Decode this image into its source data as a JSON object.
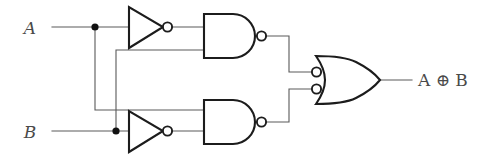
{
  "diagram": {
    "type": "logic-circuit",
    "colors": {
      "gate_stroke": "#1c1c1c",
      "wire_stroke": "#5a5a5a",
      "junction_fill": "#111111",
      "text_fill": "#4a4a4a",
      "background": "#ffffff"
    },
    "inputs": [
      {
        "id": "input-a",
        "label": "A",
        "x": 30,
        "y": 34,
        "wire_y": 27
      },
      {
        "id": "input-b",
        "label": "B",
        "x": 30,
        "y": 138,
        "wire_y": 131
      }
    ],
    "output": {
      "id": "output-xor",
      "label": "A ⊕ B",
      "operand_left": "A",
      "operator": "⊕",
      "operand_right": "B",
      "x": 418,
      "y": 84
    },
    "gates": [
      {
        "id": "inverter-top",
        "kind": "NOT",
        "label": "inverter",
        "x": 128,
        "y": 27
      },
      {
        "id": "inverter-bottom",
        "kind": "NOT",
        "label": "inverter",
        "x": 128,
        "y": 131
      },
      {
        "id": "nand-top",
        "kind": "NAND",
        "label": "NAND",
        "x": 203,
        "y": 36
      },
      {
        "id": "nand-bottom",
        "kind": "NAND",
        "label": "NAND",
        "x": 203,
        "y": 122
      },
      {
        "id": "or-output",
        "kind": "OR-inverted-inputs",
        "label": "OR",
        "x": 313,
        "y": 78
      }
    ],
    "junctions": [
      {
        "id": "junction-a",
        "on": "A",
        "x": 95,
        "y": 27
      },
      {
        "id": "junction-b",
        "on": "B",
        "x": 116,
        "y": 131
      }
    ]
  }
}
